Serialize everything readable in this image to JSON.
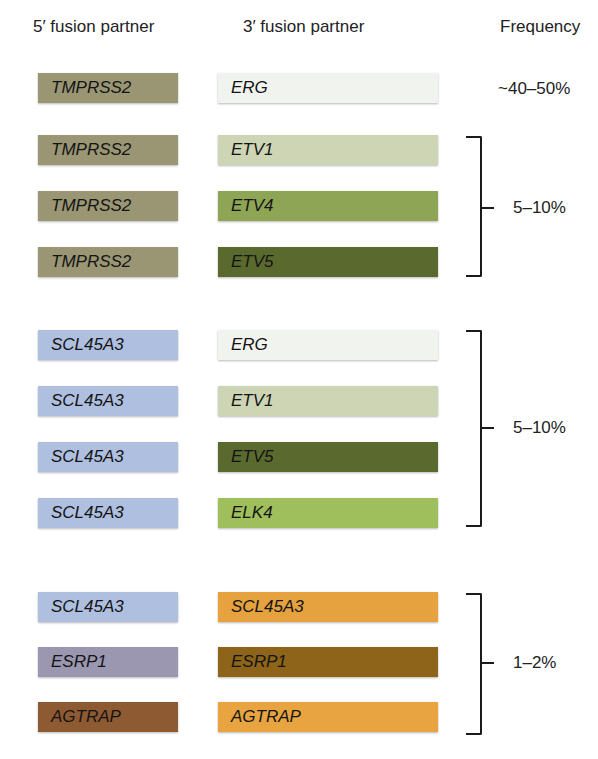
{
  "headers": {
    "five_prime": "5′ fusion partner",
    "three_prime": "3′ fusion partner",
    "frequency": "Frequency"
  },
  "colors": {
    "TMPRSS2": "#9a9674",
    "SCL45A3_left": "#aebfdf",
    "ESRP1_left": "#9b97b0",
    "AGTRAP_left": "#8e5a32",
    "ERG": "#f1f3ef",
    "ETV1": "#cdd5b4",
    "ETV4": "#8ea556",
    "ETV5": "#5a6a2e",
    "ELK4": "#9fbe5c",
    "SCL45A3_right": "#e5a23e",
    "ESRP1_right": "#8d6419",
    "AGTRAP_right": "#e8a440"
  },
  "rows": [
    {
      "five": "TMPRSS2",
      "three": "ERG",
      "five_color": "#9a9674",
      "three_color": "#f1f3ef",
      "top": 73
    },
    {
      "five": "TMPRSS2",
      "three": "ETV1",
      "five_color": "#9a9674",
      "three_color": "#cdd5b4",
      "top": 135
    },
    {
      "five": "TMPRSS2",
      "three": "ETV4",
      "five_color": "#9a9674",
      "three_color": "#8ea556",
      "top": 191
    },
    {
      "five": "TMPRSS2",
      "three": "ETV5",
      "five_color": "#9a9674",
      "three_color": "#5a6a2e",
      "top": 247
    },
    {
      "five": "SCL45A3",
      "three": "ERG",
      "five_color": "#aebfdf",
      "three_color": "#f1f3ef",
      "top": 330
    },
    {
      "five": "SCL45A3",
      "three": "ETV1",
      "five_color": "#aebfdf",
      "three_color": "#cdd5b4",
      "top": 386
    },
    {
      "five": "SCL45A3",
      "three": "ETV5",
      "five_color": "#aebfdf",
      "three_color": "#5a6a2e",
      "top": 442
    },
    {
      "five": "SCL45A3",
      "three": "ELK4",
      "five_color": "#aebfdf",
      "three_color": "#9fbe5c",
      "top": 498
    },
    {
      "five": "SCL45A3",
      "three": "SCL45A3",
      "five_color": "#aebfdf",
      "three_color": "#e5a23e",
      "top": 592
    },
    {
      "five": "ESRP1",
      "three": "ESRP1",
      "five_color": "#9b97b0",
      "three_color": "#8d6419",
      "top": 647
    },
    {
      "five": "AGTRAP",
      "three": "AGTRAP",
      "five_color": "#8e5a32",
      "three_color": "#e8a440",
      "top": 702
    }
  ],
  "frequencies": [
    {
      "label": "~40–50%",
      "rows": [
        0
      ]
    },
    {
      "label": "5–10%",
      "rows": [
        1,
        2,
        3
      ]
    },
    {
      "label": "5–10%",
      "rows": [
        4,
        5,
        6,
        7
      ]
    },
    {
      "label": "1–2%",
      "rows": [
        8,
        9,
        10
      ]
    }
  ]
}
